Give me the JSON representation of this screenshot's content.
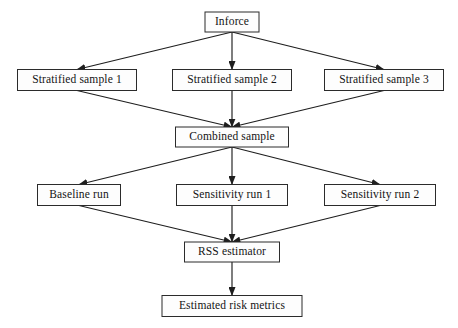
{
  "diagram": {
    "type": "flowchart",
    "background_color": "#ffffff",
    "box_fill_color": "#fdfdfd",
    "box_border_color": "#2b2b2b",
    "edge_color": "#1e1e1e",
    "text_color": "#141414",
    "nodes": [
      {
        "id": "inforce",
        "label": "Inforce",
        "x": 232,
        "y": 22,
        "w": 54,
        "h": 20
      },
      {
        "id": "stratified1",
        "label": "Stratified sample 1",
        "x": 77,
        "y": 80,
        "w": 119,
        "h": 21
      },
      {
        "id": "stratified2",
        "label": "Stratified sample 2",
        "x": 232,
        "y": 80,
        "w": 119,
        "h": 21
      },
      {
        "id": "stratified3",
        "label": "Stratified sample 3",
        "x": 384,
        "y": 80,
        "w": 119,
        "h": 21
      },
      {
        "id": "combined",
        "label": "Combined sample",
        "x": 232,
        "y": 137,
        "w": 113,
        "h": 20
      },
      {
        "id": "baseline",
        "label": "Baseline run",
        "x": 79,
        "y": 195,
        "w": 83,
        "h": 21
      },
      {
        "id": "sensitivity1",
        "label": "Sensitivity run 1",
        "x": 232,
        "y": 195,
        "w": 111,
        "h": 21
      },
      {
        "id": "sensitivity2",
        "label": "Sensitivity run 2",
        "x": 380,
        "y": 195,
        "w": 111,
        "h": 21
      },
      {
        "id": "rss",
        "label": "RSS estimator",
        "x": 232,
        "y": 252,
        "w": 95,
        "h": 20
      },
      {
        "id": "estimated",
        "label": "Estimated risk metrics",
        "x": 232,
        "y": 306,
        "w": 140,
        "h": 21
      }
    ],
    "edges": [
      {
        "from": "inforce",
        "to": "stratified1"
      },
      {
        "from": "inforce",
        "to": "stratified2"
      },
      {
        "from": "inforce",
        "to": "stratified3"
      },
      {
        "from": "stratified1",
        "to": "combined"
      },
      {
        "from": "stratified2",
        "to": "combined"
      },
      {
        "from": "stratified3",
        "to": "combined"
      },
      {
        "from": "combined",
        "to": "baseline"
      },
      {
        "from": "combined",
        "to": "sensitivity1"
      },
      {
        "from": "combined",
        "to": "sensitivity2"
      },
      {
        "from": "baseline",
        "to": "rss"
      },
      {
        "from": "sensitivity1",
        "to": "rss"
      },
      {
        "from": "sensitivity2",
        "to": "rss"
      },
      {
        "from": "rss",
        "to": "estimated"
      }
    ]
  }
}
